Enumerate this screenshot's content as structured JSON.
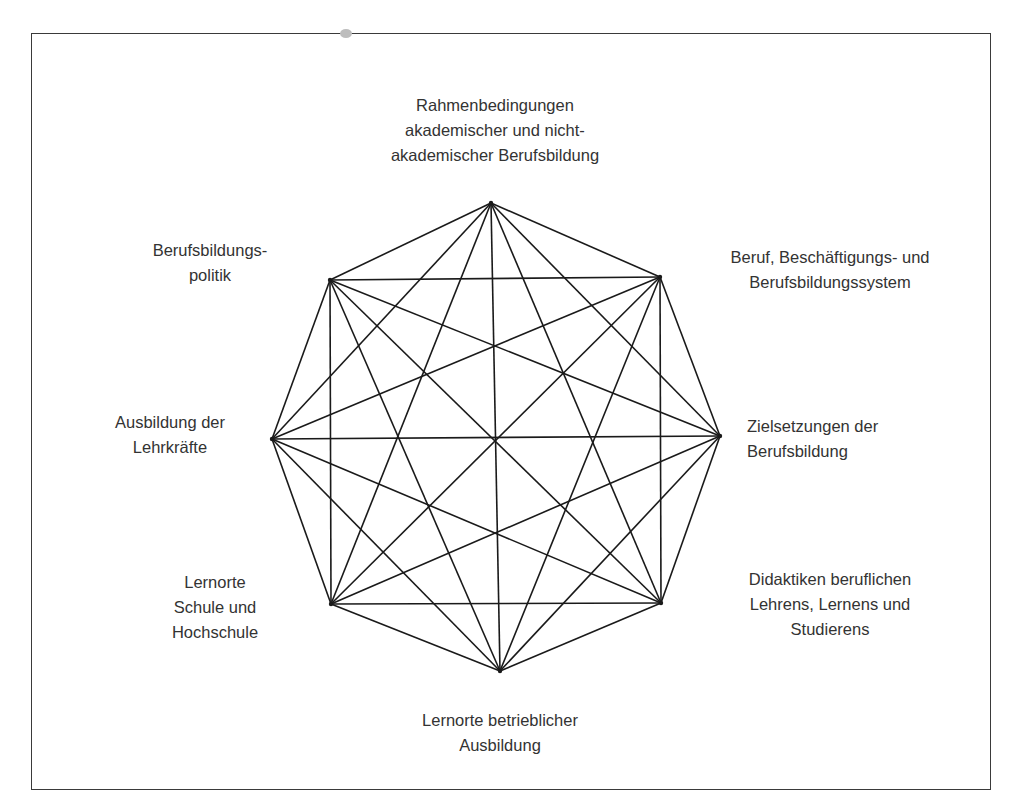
{
  "diagram": {
    "type": "complete-graph-octagon",
    "line_color": "#1a1a1a",
    "text_color": "#333333",
    "nodes": [
      {
        "id": "rahmenbedingungen",
        "lines": [
          "Rahmenbedingungen",
          "akademischer und nicht-",
          "akademischer Berufsbildung"
        ]
      },
      {
        "id": "beruf-system",
        "lines": [
          "Beruf, Beschäftigungs- und",
          "Berufsbildungssystem"
        ]
      },
      {
        "id": "zielsetzungen",
        "lines": [
          "Zielsetzungen der",
          "Berufsbildung"
        ]
      },
      {
        "id": "didaktiken",
        "lines": [
          "Didaktiken beruflichen",
          "Lehrens, Lernens und",
          "Studierens"
        ]
      },
      {
        "id": "lernorte-betrieb",
        "lines": [
          "Lernorte betrieblicher",
          "Ausbildung"
        ]
      },
      {
        "id": "lernorte-schule",
        "lines": [
          "Lernorte",
          "Schule und",
          "Hochschule"
        ]
      },
      {
        "id": "ausbildung-lehrkraefte",
        "lines": [
          "Ausbildung der",
          "Lehrkräfte"
        ]
      },
      {
        "id": "berufsbildungspolitik",
        "lines": [
          "Berufsbildungs-",
          "politik"
        ]
      }
    ],
    "edges": "all-pairs"
  }
}
